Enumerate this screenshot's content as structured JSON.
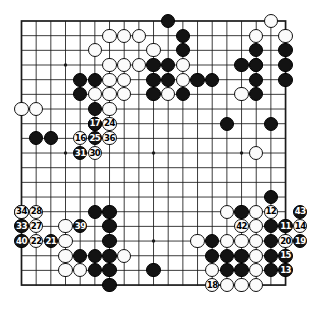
{
  "figure": {
    "type": "go-board-diagram",
    "title": "",
    "board_size": 19,
    "background_color": "#ffffff",
    "line_color": "#1a1a1a",
    "black_color": "#131313",
    "white_color": "#fbfbfb",
    "geometry": {
      "left": 21.5,
      "top": 21.0,
      "spacing": 14.67,
      "stone_diameter": 14.2
    },
    "star_points": [
      [
        3,
        3
      ],
      [
        9,
        3
      ],
      [
        15,
        3
      ],
      [
        3,
        9
      ],
      [
        9,
        9
      ],
      [
        15,
        9
      ],
      [
        3,
        15
      ],
      [
        9,
        15
      ],
      [
        15,
        15
      ]
    ]
  },
  "chart_data": {
    "type": "table",
    "xlabel": "",
    "ylabel": "",
    "legend": [
      "black stone",
      "white stone",
      "numbered move"
    ],
    "plain_black_stones": [
      [
        10,
        0
      ],
      [
        11,
        1
      ],
      [
        11,
        2
      ],
      [
        16,
        2
      ],
      [
        18,
        2
      ],
      [
        9,
        3
      ],
      [
        10,
        3
      ],
      [
        15,
        3
      ],
      [
        16,
        3
      ],
      [
        18,
        3
      ],
      [
        4,
        4
      ],
      [
        5,
        4
      ],
      [
        9,
        4
      ],
      [
        10,
        4
      ],
      [
        12,
        4
      ],
      [
        13,
        4
      ],
      [
        16,
        4
      ],
      [
        18,
        4
      ],
      [
        4,
        5
      ],
      [
        9,
        5
      ],
      [
        11,
        5
      ],
      [
        16,
        5
      ],
      [
        5,
        6
      ],
      [
        5,
        7
      ],
      [
        14,
        7
      ],
      [
        17,
        7
      ],
      [
        1,
        8
      ],
      [
        2,
        8
      ],
      [
        17,
        12
      ],
      [
        5,
        13
      ],
      [
        6,
        13
      ],
      [
        15,
        13
      ],
      [
        0,
        13
      ],
      [
        6,
        14
      ],
      [
        17,
        14
      ],
      [
        6,
        15
      ],
      [
        13,
        15
      ],
      [
        17,
        15
      ],
      [
        5,
        16
      ],
      [
        6,
        16
      ],
      [
        13,
        16
      ],
      [
        14,
        16
      ],
      [
        15,
        16
      ],
      [
        17,
        16
      ],
      [
        4,
        16
      ],
      [
        5,
        17
      ],
      [
        6,
        17
      ],
      [
        9,
        17
      ],
      [
        14,
        17
      ],
      [
        15,
        17
      ],
      [
        17,
        17
      ],
      [
        6,
        18
      ]
    ],
    "plain_white_stones": [
      [
        17,
        0
      ],
      [
        6,
        1
      ],
      [
        7,
        1
      ],
      [
        8,
        1
      ],
      [
        16,
        1
      ],
      [
        18,
        1
      ],
      [
        5,
        2
      ],
      [
        9,
        2
      ],
      [
        6,
        3
      ],
      [
        7,
        3
      ],
      [
        8,
        3
      ],
      [
        11,
        3
      ],
      [
        16,
        3
      ],
      [
        6,
        4
      ],
      [
        7,
        4
      ],
      [
        11,
        4
      ],
      [
        5,
        5
      ],
      [
        6,
        5
      ],
      [
        7,
        5
      ],
      [
        10,
        5
      ],
      [
        15,
        5
      ],
      [
        0,
        6
      ],
      [
        1,
        6
      ],
      [
        6,
        6
      ],
      [
        16,
        9
      ],
      [
        14,
        13
      ],
      [
        16,
        13
      ],
      [
        3,
        14
      ],
      [
        16,
        14
      ],
      [
        3,
        15
      ],
      [
        12,
        15
      ],
      [
        14,
        15
      ],
      [
        15,
        15
      ],
      [
        16,
        15
      ],
      [
        3,
        16
      ],
      [
        7,
        16
      ],
      [
        16,
        16
      ],
      [
        13,
        17
      ],
      [
        16,
        17
      ],
      [
        3,
        17
      ],
      [
        4,
        17
      ],
      [
        14,
        18
      ],
      [
        15,
        18
      ],
      [
        16,
        18
      ]
    ],
    "numbered_moves": [
      {
        "number": 11,
        "color": "black",
        "col": 18,
        "row": 14
      },
      {
        "number": 12,
        "color": "white",
        "col": 17,
        "row": 13
      },
      {
        "number": 13,
        "color": "black",
        "col": 18,
        "row": 17
      },
      {
        "number": 14,
        "color": "white",
        "col": 19,
        "row": 14
      },
      {
        "number": 15,
        "color": "black",
        "col": 18,
        "row": 16
      },
      {
        "number": 16,
        "color": "white",
        "col": 4,
        "row": 8
      },
      {
        "number": 17,
        "color": "black",
        "col": 5,
        "row": 7
      },
      {
        "number": 18,
        "color": "white",
        "col": 13,
        "row": 18
      },
      {
        "number": 19,
        "color": "black",
        "col": 19,
        "row": 15
      },
      {
        "number": 20,
        "color": "white",
        "col": 18,
        "row": 15
      },
      {
        "number": 21,
        "color": "black",
        "col": 2,
        "row": 15
      },
      {
        "number": 22,
        "color": "white",
        "col": 1,
        "row": 15
      },
      {
        "number": 24,
        "color": "white",
        "col": 6,
        "row": 7
      },
      {
        "number": 25,
        "color": "black",
        "col": 5,
        "row": 8
      },
      {
        "number": 27,
        "color": "white",
        "col": 1,
        "row": 14
      },
      {
        "number": 28,
        "color": "white",
        "col": 1,
        "row": 13
      },
      {
        "number": 30,
        "color": "white",
        "col": 5,
        "row": 9
      },
      {
        "number": 31,
        "color": "black",
        "col": 4,
        "row": 9
      },
      {
        "number": 33,
        "color": "black",
        "col": 0,
        "row": 14
      },
      {
        "number": 34,
        "color": "white",
        "col": 0,
        "row": 13
      },
      {
        "number": 36,
        "color": "white",
        "col": 6,
        "row": 8
      },
      {
        "number": 39,
        "color": "black",
        "col": 4,
        "row": 14
      },
      {
        "number": 40,
        "color": "black",
        "col": 0,
        "row": 15
      },
      {
        "number": 42,
        "color": "white",
        "col": 15,
        "row": 14
      },
      {
        "number": 43,
        "color": "black",
        "col": 19,
        "row": 13
      }
    ]
  }
}
